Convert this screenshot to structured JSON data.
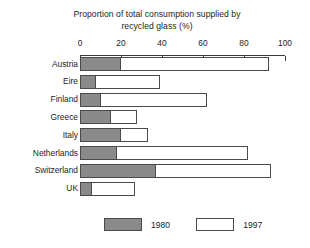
{
  "chart_data": {
    "type": "bar",
    "orientation": "horizontal",
    "title": "Proportion of total consumption supplied by recycled glass (%)",
    "title_lines": [
      "Proportion of total consumption supplied by",
      "recycled glass (%)"
    ],
    "xlabel": "",
    "ylabel": "",
    "categories": [
      "Austria",
      "Eire",
      "Finland",
      "Greece",
      "Italy",
      "Netherlands",
      "Switzerland",
      "UK"
    ],
    "series": [
      {
        "name": "1980",
        "color": "#8a8a8a",
        "values": [
          20,
          8,
          10,
          15,
          20,
          18,
          37,
          6
        ]
      },
      {
        "name": "1997",
        "color": "#ffffff",
        "values": [
          92,
          39,
          62,
          28,
          33,
          82,
          93,
          27
        ]
      }
    ],
    "legend": [
      "1980",
      "1997"
    ],
    "legend_position": "bottom",
    "xlim": [
      0,
      100
    ],
    "xticks": [
      0,
      20,
      40,
      60,
      80,
      100
    ],
    "xtick_labels": [
      "0",
      "20",
      "40",
      "60",
      "80",
      "100"
    ],
    "grid": false,
    "note": "Bars are overlaid: the 1997 bar spans from 0 to its value and the 1980 bar is drawn on top from 0 to its value."
  },
  "legend": {
    "items": [
      {
        "label": "1980",
        "swatch": "gray-filled-swatch"
      },
      {
        "label": "1997",
        "swatch": "white-outline-swatch"
      }
    ]
  }
}
